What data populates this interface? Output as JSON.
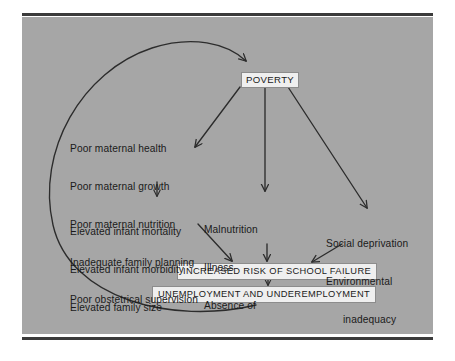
{
  "figure": {
    "background_color": "#a6a6a6",
    "page_color": "#ffffff",
    "rule_color": "#3b3b3b",
    "box_fill": "#efefef",
    "ink_color": "#1a1a1a"
  },
  "nodes": {
    "poverty": {
      "label": "POVERTY"
    },
    "school_failure": {
      "label": "INCREASED RISK OF SCHOOL FAILURE"
    },
    "unemployment": {
      "label": "UNEMPLOYMENT AND UNDEREMPLOYMENT"
    }
  },
  "blocks": {
    "maternal": {
      "name": "maternal-factors",
      "lines": [
        "Poor maternal health",
        "Poor maternal growth",
        "Poor maternal nutrition",
        "Inadequate family planning",
        "Poor obstetrical supervision"
      ]
    },
    "infant": {
      "name": "infant-outcomes",
      "lines": [
        "Elevated infant mortality",
        "Elevated infant morbidity",
        "Elevated family size"
      ]
    },
    "malnutrition": {
      "name": "health-deficits",
      "lines": [
        "Malnutrition",
        "Illness",
        "Absence of",
        "medical care"
      ],
      "indented_line_indexes": [
        3
      ]
    },
    "social": {
      "name": "social-deficits",
      "lines": [
        "Social deprivation",
        "Environmental",
        "inadequacy"
      ],
      "indented_line_indexes": [
        2
      ]
    }
  },
  "edges": [
    {
      "name": "poverty-to-maternal",
      "from": "poverty",
      "to": "maternal"
    },
    {
      "name": "poverty-to-malnutrition",
      "from": "poverty",
      "to": "malnutrition"
    },
    {
      "name": "poverty-to-social",
      "from": "poverty",
      "to": "social"
    },
    {
      "name": "maternal-to-infant",
      "from": "maternal",
      "to": "infant"
    },
    {
      "name": "infant-to-school-failure",
      "from": "infant",
      "to": "school_failure"
    },
    {
      "name": "malnutrition-to-school-failure",
      "from": "malnutrition",
      "to": "school_failure"
    },
    {
      "name": "social-to-school-failure",
      "from": "social",
      "to": "school_failure"
    },
    {
      "name": "school-failure-to-unemployment",
      "from": "school_failure",
      "to": "unemployment"
    },
    {
      "name": "unemployment-to-poverty-loop",
      "from": "unemployment",
      "to": "poverty",
      "style": "long-curved-feedback-loop"
    }
  ]
}
